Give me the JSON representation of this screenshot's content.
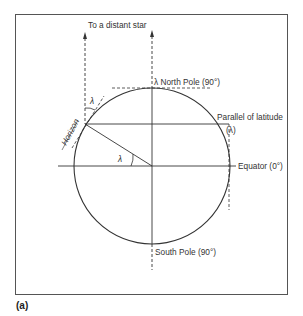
{
  "figure": {
    "caption": "(a)",
    "labels": {
      "distant_star": "To a distant star",
      "north_pole": "λ North Pole (90°)",
      "parallel": "Parallel of latitude",
      "parallel_symbol": "(λ)",
      "equator": "Equator (0°)",
      "south_pole": "South Pole (90°)",
      "horizon": "Horizon",
      "angle_top": "λ",
      "angle_center": "λ"
    },
    "colors": {
      "line": "#333333",
      "frame": "#555555",
      "background": "#ffffff"
    }
  }
}
